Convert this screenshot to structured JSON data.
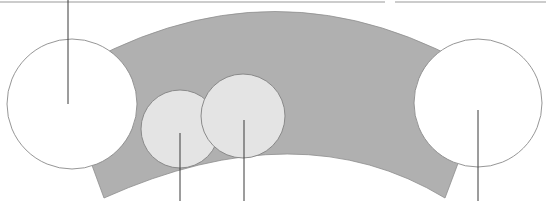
{
  "diagram": {
    "type": "arch-band-with-circles",
    "canvas": {
      "width": 546,
      "height": 201
    },
    "colors": {
      "background": "#ffffff",
      "band_fill": "#b0b0b0",
      "band_stroke": "#8e8e8e",
      "large_circle_fill": "#ffffff",
      "large_circle_stroke": "#8a8a8a",
      "small_circle_fill": "#e4e4e4",
      "small_circle_stroke": "#8a8a8a",
      "leader_line": "#3a3a3a",
      "frame_line": "#9a9a9a"
    },
    "top_frames": [
      {
        "id": "left-frame-edge",
        "x1": 0,
        "x2": 385,
        "y": 2
      },
      {
        "id": "right-frame-edge",
        "x1": 395,
        "x2": 546,
        "y": 2
      }
    ],
    "band": {
      "outer_arc_peak_y": 10,
      "bottom_left_corner": [
        104,
        198
      ],
      "bottom_right_corner": [
        445,
        198
      ]
    },
    "circles": [
      {
        "id": "large-left",
        "kind": "large",
        "cx": 72,
        "cy": 104,
        "r": 65
      },
      {
        "id": "small-left",
        "kind": "small",
        "cx": 180,
        "cy": 129,
        "r": 39
      },
      {
        "id": "small-right",
        "kind": "small",
        "cx": 243,
        "cy": 116,
        "r": 42
      },
      {
        "id": "large-right",
        "kind": "large",
        "cx": 478,
        "cy": 103,
        "r": 64
      }
    ],
    "leader_lines": [
      {
        "id": "leader-large-left",
        "x": 68,
        "y1": 0,
        "y2": 104,
        "direction": "up"
      },
      {
        "id": "leader-small-left",
        "x": 180,
        "y1": 133,
        "y2": 201,
        "direction": "down"
      },
      {
        "id": "leader-small-right",
        "x": 244,
        "y1": 120,
        "y2": 201,
        "direction": "down"
      },
      {
        "id": "leader-large-right",
        "x": 478,
        "y1": 110,
        "y2": 201,
        "direction": "down"
      }
    ]
  }
}
